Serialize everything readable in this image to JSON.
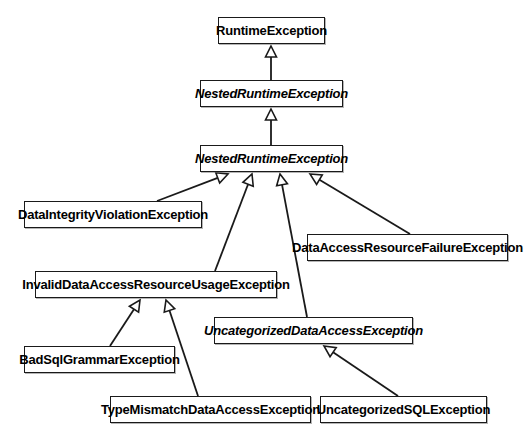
{
  "diagram": {
    "kind": "uml-class-hierarchy",
    "background_color": "#ffffff",
    "line_color": "#1a1a1a",
    "text_color": "#000000",
    "classes": [
      {
        "id": "runtime-exception",
        "label": "RuntimeException",
        "abstract": false,
        "x": 218,
        "y": 17,
        "w": 107,
        "h": 27
      },
      {
        "id": "nested-runtime-exception-upper",
        "label": "NestedRuntimeException",
        "abstract": true,
        "x": 200,
        "y": 80,
        "w": 143,
        "h": 27
      },
      {
        "id": "nested-runtime-exception-lower",
        "label": "NestedRuntimeException",
        "abstract": true,
        "x": 200,
        "y": 145,
        "w": 143,
        "h": 27
      },
      {
        "id": "data-integrity-violation-exception",
        "label": "DataIntegrityViolationException",
        "abstract": false,
        "x": 24,
        "y": 201,
        "w": 178,
        "h": 27
      },
      {
        "id": "data-access-resource-failure-exception",
        "label": "DataAccessResourceFailureException",
        "abstract": false,
        "x": 307,
        "y": 234,
        "w": 201,
        "h": 27
      },
      {
        "id": "invalid-data-access-resource-usage-exception",
        "label": "InvalidDataAccessResourceUsageException",
        "abstract": false,
        "x": 35,
        "y": 271,
        "w": 242,
        "h": 27
      },
      {
        "id": "uncategorized-data-access-exception",
        "label": "UncategorizedDataAccessException",
        "abstract": true,
        "x": 214,
        "y": 317,
        "w": 199,
        "h": 27
      },
      {
        "id": "bad-sql-grammar-exception",
        "label": "BadSqlGrammarException",
        "abstract": false,
        "x": 24,
        "y": 346,
        "w": 151,
        "h": 27
      },
      {
        "id": "type-mismatch-data-access-exception",
        "label": "TypeMismatchDataAccessException",
        "abstract": false,
        "x": 110,
        "y": 396,
        "w": 201,
        "h": 27
      },
      {
        "id": "uncategorized-sql-exception",
        "label": "UncategorizedSQLException",
        "abstract": false,
        "x": 320,
        "y": 396,
        "w": 167,
        "h": 27
      }
    ],
    "generalizations": [
      {
        "from": "nested-runtime-exception-upper",
        "to": "runtime-exception",
        "x1": 271,
        "y1": 80,
        "x2": 271,
        "y2": 46
      },
      {
        "from": "nested-runtime-exception-lower",
        "to": "nested-runtime-exception-upper",
        "x1": 271,
        "y1": 145,
        "x2": 271,
        "y2": 109
      },
      {
        "from": "data-integrity-violation-exception",
        "to": "nested-runtime-exception-lower",
        "x1": 157,
        "y1": 201,
        "x2": 228,
        "y2": 174
      },
      {
        "from": "invalid-data-access-resource-usage-exception",
        "to": "nested-runtime-exception-lower",
        "x1": 215,
        "y1": 271,
        "x2": 252,
        "y2": 174
      },
      {
        "from": "uncategorized-data-access-exception",
        "to": "nested-runtime-exception-lower",
        "x1": 307,
        "y1": 317,
        "x2": 280,
        "y2": 174
      },
      {
        "from": "data-access-resource-failure-exception",
        "to": "nested-runtime-exception-lower",
        "x1": 410,
        "y1": 234,
        "x2": 310,
        "y2": 174
      },
      {
        "from": "bad-sql-grammar-exception",
        "to": "invalid-data-access-resource-usage-exception",
        "x1": 110,
        "y1": 346,
        "x2": 140,
        "y2": 300
      },
      {
        "from": "type-mismatch-data-access-exception",
        "to": "invalid-data-access-resource-usage-exception",
        "x1": 198,
        "y1": 396,
        "x2": 166,
        "y2": 300
      },
      {
        "from": "uncategorized-sql-exception",
        "to": "uncategorized-data-access-exception",
        "x1": 398,
        "y1": 396,
        "x2": 324,
        "y2": 346
      }
    ]
  }
}
